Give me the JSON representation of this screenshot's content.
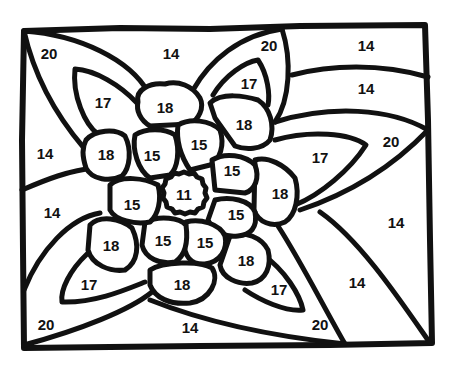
{
  "page": {
    "type": "color-by-number worksheet"
  },
  "regions": [
    {
      "id": "corner-tl",
      "number": "20",
      "x": 49,
      "y": 53
    },
    {
      "id": "top-center",
      "number": "14",
      "x": 171,
      "y": 53
    },
    {
      "id": "top-mid-right",
      "number": "20",
      "x": 269,
      "y": 45
    },
    {
      "id": "top-right",
      "number": "14",
      "x": 366,
      "y": 45
    },
    {
      "id": "leaf-tl",
      "number": "17",
      "x": 103,
      "y": 102
    },
    {
      "id": "leaf-top",
      "number": "17",
      "x": 249,
      "y": 83
    },
    {
      "id": "stripe-right-upper",
      "number": "14",
      "x": 366,
      "y": 88
    },
    {
      "id": "petal-outer-top",
      "number": "18",
      "x": 165,
      "y": 107
    },
    {
      "id": "petal-outer-tr",
      "number": "18",
      "x": 244,
      "y": 124
    },
    {
      "id": "right-mid",
      "number": "20",
      "x": 391,
      "y": 141
    },
    {
      "id": "left-mid",
      "number": "14",
      "x": 45,
      "y": 153
    },
    {
      "id": "petal-outer-left",
      "number": "18",
      "x": 106,
      "y": 154
    },
    {
      "id": "petal-inner-tl",
      "number": "15",
      "x": 152,
      "y": 155
    },
    {
      "id": "petal-inner-top",
      "number": "15",
      "x": 199,
      "y": 144
    },
    {
      "id": "leaf-right",
      "number": "17",
      "x": 320,
      "y": 157
    },
    {
      "id": "petal-inner-tr",
      "number": "15",
      "x": 232,
      "y": 170
    },
    {
      "id": "center",
      "number": "11",
      "x": 184,
      "y": 194
    },
    {
      "id": "petal-outer-right",
      "number": "18",
      "x": 280,
      "y": 193
    },
    {
      "id": "petal-inner-left",
      "number": "15",
      "x": 132,
      "y": 204
    },
    {
      "id": "left-lower",
      "number": "14",
      "x": 52,
      "y": 212
    },
    {
      "id": "petal-inner-br",
      "number": "15",
      "x": 236,
      "y": 214
    },
    {
      "id": "right-lower",
      "number": "14",
      "x": 396,
      "y": 222
    },
    {
      "id": "petal-outer-bl",
      "number": "18",
      "x": 111,
      "y": 245
    },
    {
      "id": "petal-inner-bl",
      "number": "15",
      "x": 163,
      "y": 240
    },
    {
      "id": "petal-inner-bottom",
      "number": "15",
      "x": 205,
      "y": 242
    },
    {
      "id": "petal-outer-br",
      "number": "18",
      "x": 246,
      "y": 260
    },
    {
      "id": "leaf-bl",
      "number": "17",
      "x": 89,
      "y": 284
    },
    {
      "id": "petal-outer-bottom",
      "number": "18",
      "x": 182,
      "y": 284
    },
    {
      "id": "bottom-right-mid",
      "number": "14",
      "x": 357,
      "y": 282
    },
    {
      "id": "leaf-br",
      "number": "17",
      "x": 279,
      "y": 289
    },
    {
      "id": "corner-bl",
      "number": "20",
      "x": 46,
      "y": 324
    },
    {
      "id": "bottom-center",
      "number": "14",
      "x": 190,
      "y": 327
    },
    {
      "id": "corner-br",
      "number": "20",
      "x": 320,
      "y": 324
    }
  ]
}
